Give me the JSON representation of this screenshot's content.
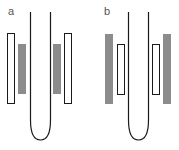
{
  "panels": [
    {
      "label": "a",
      "outer_electrodes": "hollow",
      "inner_electrodes": "filled"
    },
    {
      "label": "b",
      "outer_electrodes": "filled",
      "inner_electrodes": "hollow"
    }
  ],
  "colors": {
    "stroke": "#1a1a1a",
    "fill": "#8c8c8c"
  }
}
